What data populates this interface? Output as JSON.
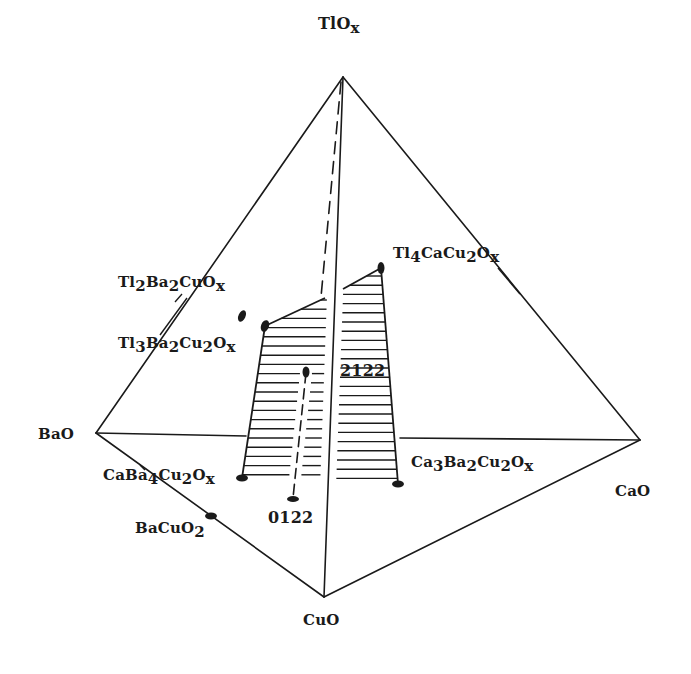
{
  "colors": {
    "ink": "#1a1a1a",
    "background": "#ffffff"
  },
  "vertices": {
    "apex": {
      "label": "Tl",
      "sub": "",
      "mid": "O",
      "suffix": "x",
      "formula": "TlOx"
    },
    "bao": {
      "formula": "BaO"
    },
    "cao": {
      "formula": "CaO"
    },
    "cuo": {
      "formula": "CuO"
    }
  },
  "labels": {
    "tl2ba2cuox": [
      {
        "t": "Tl"
      },
      {
        "t": "2",
        "s": true
      },
      {
        "t": "Ba"
      },
      {
        "t": "2",
        "s": true
      },
      {
        "t": "CuO"
      },
      {
        "t": "x",
        "s": true
      }
    ],
    "tl3ba2cu2ox": [
      {
        "t": "Tl"
      },
      {
        "t": "3",
        "s": true
      },
      {
        "t": "Ba"
      },
      {
        "t": "2",
        "s": true
      },
      {
        "t": "Cu"
      },
      {
        "t": "2",
        "s": true
      },
      {
        "t": "O"
      },
      {
        "t": "x",
        "s": true
      }
    ],
    "tl4cacu2ox": [
      {
        "t": "Tl"
      },
      {
        "t": "4",
        "s": true
      },
      {
        "t": "CaCu"
      },
      {
        "t": "2",
        "s": true
      },
      {
        "t": "O"
      },
      {
        "t": "x",
        "s": true
      }
    ],
    "caba4cu2ox": [
      {
        "t": "CaBa"
      },
      {
        "t": "4",
        "s": true
      },
      {
        "t": "Cu"
      },
      {
        "t": "2",
        "s": true
      },
      {
        "t": "O"
      },
      {
        "t": "x",
        "s": true
      }
    ],
    "ca3ba2cu2ox": [
      {
        "t": "Ca"
      },
      {
        "t": "3",
        "s": true
      },
      {
        "t": "Ba"
      },
      {
        "t": "2",
        "s": true
      },
      {
        "t": "Cu"
      },
      {
        "t": "2",
        "s": true
      },
      {
        "t": "O"
      },
      {
        "t": "x",
        "s": true
      }
    ],
    "bacuo2": [
      {
        "t": "BaCuO"
      },
      {
        "t": "2",
        "s": true
      }
    ],
    "phase_2122": "2122",
    "phase_0122": "0122"
  }
}
